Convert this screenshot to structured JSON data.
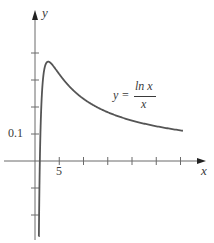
{
  "chart_data": {
    "type": "line",
    "title": "",
    "xlabel": "x",
    "ylabel": "y",
    "annotation": {
      "lhs": "y =",
      "numerator": "ln x",
      "denominator": "x"
    },
    "x_tick_labels": [
      {
        "value": 5,
        "label": "5"
      }
    ],
    "y_tick_labels": [
      {
        "value": 0.1,
        "label": "0.1"
      }
    ],
    "x_ticks": [
      5,
      10,
      15,
      20,
      25,
      30
    ],
    "y_ticks": [
      -0.2,
      -0.1,
      0.1,
      0.2,
      0.3,
      0.4
    ],
    "xlim": [
      -7,
      35
    ],
    "ylim": [
      -0.3,
      0.6
    ],
    "grid": false,
    "legend": null,
    "series": [
      {
        "name": "y = ln x / x",
        "function": "ln(x)/x",
        "x_domain": [
          0.9,
          30.5
        ],
        "points": [
          [
            1,
            0
          ],
          [
            1.5,
            0.27
          ],
          [
            2,
            0.347
          ],
          [
            2.718,
            0.368
          ],
          [
            4,
            0.347
          ],
          [
            5,
            0.322
          ],
          [
            8,
            0.26
          ],
          [
            10,
            0.23
          ],
          [
            15,
            0.18
          ],
          [
            20,
            0.15
          ],
          [
            25,
            0.129
          ],
          [
            30,
            0.113
          ]
        ]
      }
    ],
    "colors": {
      "axis": "#6a6a6a",
      "curve": "#555555",
      "text": "#3a3a3a"
    }
  }
}
